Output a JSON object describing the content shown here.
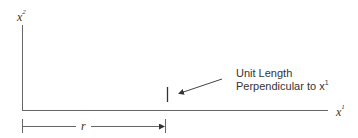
{
  "diagram": {
    "y_axis_label": {
      "base": "x",
      "sup": "2"
    },
    "x_axis_label": {
      "base": "x",
      "sup": "1"
    },
    "annotation": {
      "line1": "Unit Length",
      "line2_text": "Perpendicular to x",
      "line2_sup": "1"
    },
    "dimension_label": "r",
    "colors": {
      "stroke": "#555555",
      "text": "#333333"
    }
  }
}
